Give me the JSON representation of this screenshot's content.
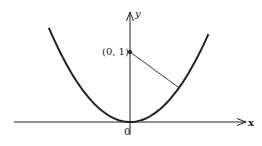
{
  "diagram": {
    "curve": "y = x^2",
    "x_axis_label": "x",
    "y_axis_label": "y",
    "origin_label": "0",
    "point_label": "(0, 1)",
    "point": [
      0,
      1
    ],
    "segment_end": [
      0.7,
      0.49
    ],
    "x_range": [
      -1.16,
      1.12
    ],
    "colors": {
      "ink": "#222222",
      "background": "#ffffff"
    }
  }
}
